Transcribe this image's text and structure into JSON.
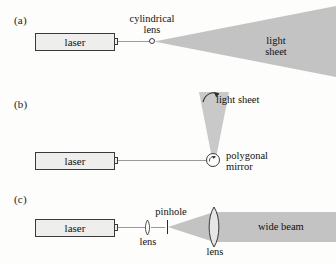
{
  "figure": {
    "background": "#fdfdfb",
    "beam_color": "#9a9a9a",
    "sheet_color": "#c3c3c3",
    "outline_color": "#3a3a3a",
    "box_fill": "#eeeeec"
  },
  "panels": [
    {
      "id": "a",
      "label": "(a)",
      "source_label": "laser",
      "optic_label": "cylindrical\nlens",
      "output_label": "light\nsheet",
      "optic_icon": "circle-lens-icon",
      "spread": "horizontal-wedge"
    },
    {
      "id": "b",
      "label": "(b)",
      "source_label": "laser",
      "optic_label": "polygonal\nmirror",
      "output_label": "light sheet",
      "optic_icon": "rotating-mirror-icon",
      "spread": "vertical-wedge"
    },
    {
      "id": "c",
      "label": "(c)",
      "source_label": "laser",
      "optic_label_1": "lens",
      "optic_label_2": "pinhole",
      "optic_label_3": "lens",
      "output_label": "wide beam",
      "optic_icon_1": "biconvex-lens-icon",
      "optic_icon_2": "pinhole-aperture-icon",
      "optic_icon_3": "biconvex-lens-icon",
      "spread": "expanding-then-collimated"
    }
  ]
}
